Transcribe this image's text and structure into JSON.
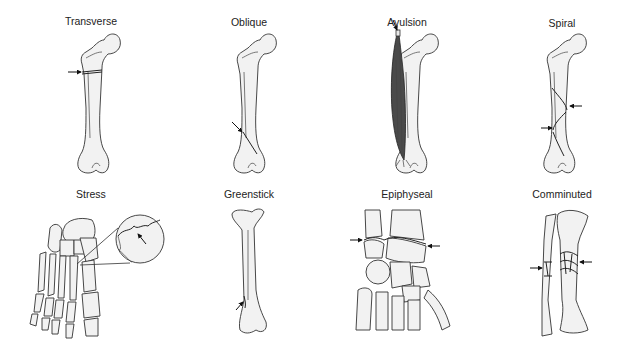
{
  "figure": {
    "panels": [
      {
        "id": "transverse",
        "label": "Transverse",
        "label_x": 91,
        "label_y": 15
      },
      {
        "id": "oblique",
        "label": "Oblique",
        "label_x": 249,
        "label_y": 16
      },
      {
        "id": "avulsion",
        "label": "Avulsion",
        "label_x": 407,
        "label_y": 16
      },
      {
        "id": "spiral",
        "label": "Spiral",
        "label_x": 562,
        "label_y": 17
      },
      {
        "id": "stress",
        "label": "Stress",
        "label_x": 91,
        "label_y": 188
      },
      {
        "id": "greenstick",
        "label": "Greenstick",
        "label_x": 249,
        "label_y": 188
      },
      {
        "id": "epiphyseal",
        "label": "Epiphyseal",
        "label_x": 407,
        "label_y": 188
      },
      {
        "id": "comminuted",
        "label": "Comminuted",
        "label_x": 562,
        "label_y": 188
      }
    ],
    "colors": {
      "bone_fill": "#f2f2f2",
      "outline": "#333333",
      "muscle": "#4a4a4a",
      "background": "#ffffff"
    }
  }
}
